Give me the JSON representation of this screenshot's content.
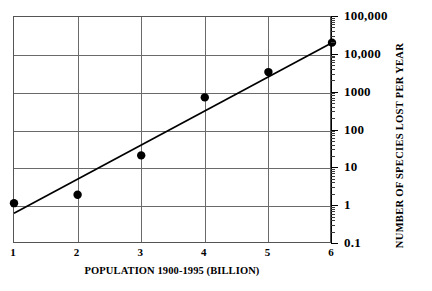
{
  "chart_data": {
    "type": "scatter",
    "title": "",
    "xlabel": "POPULATION 1900-1995 (BILLION)",
    "ylabel": "NUMBER OF SPECIES LOST PER YEAR",
    "xlim": [
      1,
      6
    ],
    "ylim": [
      0.1,
      100000
    ],
    "yscale": "log",
    "xscale": "linear",
    "grid": true,
    "legend": null,
    "x_ticks": [
      1,
      2,
      3,
      4,
      5,
      6
    ],
    "x_tick_labels": [
      "1",
      "2",
      "3",
      "4",
      "5",
      "6"
    ],
    "y_ticks": [
      0.1,
      1,
      10,
      100,
      1000,
      10000,
      100000
    ],
    "y_tick_labels": [
      "0.1",
      "1",
      "10",
      "100",
      "1000",
      "10,000",
      "100,000"
    ],
    "y_minor_ticks": true,
    "series": [
      {
        "name": "observed species loss",
        "type": "scatter",
        "marker": "filled-circle",
        "color": "#000000",
        "x": [
          1,
          2,
          3,
          4,
          5,
          6
        ],
        "y": [
          1.2,
          2.0,
          22,
          750,
          3500,
          21000
        ]
      },
      {
        "name": "fitted trend line",
        "type": "line",
        "color": "#000000",
        "x": [
          1,
          6
        ],
        "y": [
          0.65,
          21000
        ]
      }
    ]
  },
  "axes": {
    "x_title": "POPULATION 1900-1995 (BILLION)",
    "y_title": "NUMBER OF SPECIES LOST PER YEAR",
    "x_tick_labels": [
      "1",
      "2",
      "3",
      "4",
      "5",
      "6"
    ],
    "y_tick_labels": [
      "100,000",
      "10,000",
      "1000",
      "100",
      "10",
      "1",
      "0.1"
    ]
  },
  "colors": {
    "ink": "#000000",
    "grid": "#6a6a6a",
    "frame": "#555555",
    "background": "#ffffff"
  }
}
